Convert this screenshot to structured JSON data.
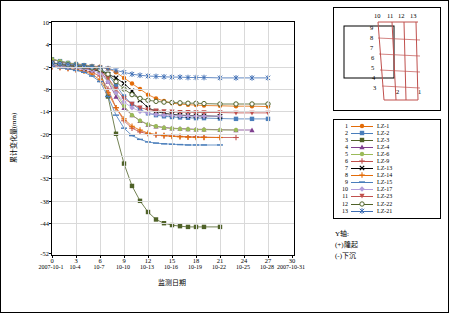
{
  "chart_data": {
    "type": "line",
    "title": "",
    "xlabel": "监测日期",
    "ylabel": "累计变化量(mm)",
    "ylim": [
      -52,
      10
    ],
    "yticks": [
      10,
      4,
      -2,
      -8,
      -14,
      -20,
      -26,
      -32,
      -38,
      -44,
      -52
    ],
    "xlim": [
      0,
      30
    ],
    "xticks": [
      0,
      3,
      6,
      9,
      12,
      15,
      18,
      21,
      24,
      27,
      30
    ],
    "xtick_dates": [
      "2007-10-1",
      "10-4",
      "10-7",
      "10-10",
      "10-13",
      "10-16",
      "10-19",
      "10-22",
      "10-25",
      "10-28",
      "2007-10-31"
    ],
    "grid": true,
    "legend_position": "right",
    "series": [
      {
        "num": "1",
        "name": "LZ-1",
        "color": "#E36C09",
        "marker": "circle",
        "x": [
          0,
          1,
          2,
          3,
          4,
          5,
          6,
          7,
          8,
          9,
          10,
          11,
          12,
          13,
          14,
          15,
          16,
          17,
          18,
          19,
          21,
          23,
          25,
          27
        ],
        "y": [
          0,
          -0.5,
          -1,
          -1.2,
          -1.5,
          -1.8,
          -2,
          -2.5,
          -3.5,
          -5,
          -6.5,
          -8,
          -9.5,
          -10.5,
          -11.2,
          -11.8,
          -12,
          -12.2,
          -12.3,
          -12.4,
          -12.5,
          -12.6,
          -12.6,
          -12.7
        ]
      },
      {
        "num": "2",
        "name": "LZ-2",
        "color": "#4A7EBB",
        "marker": "square",
        "x": [
          0,
          1,
          2,
          3,
          4,
          5,
          6,
          7,
          8,
          9,
          10,
          11,
          12,
          13,
          14,
          15,
          16,
          17,
          18,
          19,
          21,
          23,
          25,
          27
        ],
        "y": [
          0,
          -0.5,
          -1,
          -1.3,
          -1.6,
          -2,
          -2.4,
          -4,
          -7,
          -10,
          -12,
          -13.5,
          -14.5,
          -15,
          -15.3,
          -15.5,
          -15.6,
          -15.7,
          -15.8,
          -15.8,
          -15.9,
          -16,
          -16,
          -16
        ]
      },
      {
        "num": "3",
        "name": "LZ-3",
        "color": "#4F6228",
        "marker": "square-filled",
        "x": [
          0,
          1,
          2,
          3,
          4,
          5,
          6,
          7,
          8,
          9,
          10,
          11,
          12,
          13,
          14,
          15,
          16,
          17,
          18,
          19,
          21
        ],
        "y": [
          -1,
          -1.5,
          -1.8,
          -2,
          -2.2,
          -2.5,
          -3,
          -10,
          -20,
          -28,
          -34,
          -38,
          -41,
          -43,
          -44,
          -44.5,
          -44.8,
          -45,
          -45,
          -45,
          -45
        ]
      },
      {
        "num": "4",
        "name": "LZ-4",
        "color": "#7F3F8F",
        "marker": "triangle",
        "x": [
          0,
          1,
          2,
          3,
          4,
          5,
          6,
          7,
          8,
          9,
          10,
          11,
          12,
          13,
          14,
          15,
          16,
          17,
          18,
          19,
          21,
          23,
          25
        ],
        "y": [
          0,
          -0.6,
          -1.2,
          -1.5,
          -1.8,
          -2.2,
          -3,
          -6,
          -10,
          -13,
          -15,
          -16.5,
          -17.5,
          -18,
          -18.3,
          -18.5,
          -18.6,
          -18.7,
          -18.8,
          -18.8,
          -18.9,
          -19,
          -19
        ]
      },
      {
        "num": "5",
        "name": "LZ-6",
        "color": "#9BBB59",
        "marker": "circle-small",
        "x": [
          0,
          1,
          2,
          3,
          4,
          5,
          6,
          7,
          8,
          9,
          10,
          11,
          12,
          13,
          14,
          15,
          16,
          17,
          18,
          19,
          21,
          23
        ],
        "y": [
          0,
          -0.5,
          -1,
          -1.4,
          -1.7,
          -2,
          -2.5,
          -5,
          -9,
          -12.5,
          -15,
          -16.5,
          -17.5,
          -18,
          -18.4,
          -18.6,
          -18.7,
          -18.8,
          -18.9,
          -18.9,
          -19,
          -19
        ]
      },
      {
        "num": "6",
        "name": "LZ-9",
        "color": "#C0504D",
        "marker": "plus",
        "x": [
          0,
          1,
          2,
          3,
          4,
          5,
          6,
          7,
          8,
          9,
          10,
          11,
          12,
          13,
          14,
          15,
          16,
          17,
          18,
          19,
          21,
          23
        ],
        "y": [
          -2,
          -2.2,
          -2.5,
          -2.8,
          -3,
          -3.5,
          -4.5,
          -8,
          -13,
          -16.5,
          -18.5,
          -19.5,
          -20,
          -20.3,
          -20.5,
          -20.6,
          -20.7,
          -20.8,
          -20.8,
          -20.9,
          -21,
          -21
        ]
      },
      {
        "num": "7",
        "name": "LZ-13",
        "color": "#000000",
        "marker": "x",
        "x": [
          0,
          1,
          2,
          3,
          4,
          5,
          6,
          7,
          8,
          9,
          10,
          11,
          12,
          13,
          14,
          15,
          16,
          17,
          18,
          19,
          21
        ],
        "y": [
          -1.5,
          -1.8,
          -2,
          -2.2,
          -2.5,
          -2.8,
          -3.2,
          -4,
          -5,
          -6.5,
          -8.5,
          -11,
          -13,
          -14,
          -14.5,
          -14.8,
          -15,
          -15.1,
          -15.2,
          -15.2,
          -15.3
        ]
      },
      {
        "num": "8",
        "name": "LZ-14",
        "color": "#E36C09",
        "marker": "plus-thin",
        "x": [
          0,
          1,
          2,
          3,
          4,
          5,
          6,
          7,
          8,
          9,
          10,
          11,
          12,
          13,
          14,
          15,
          16,
          17,
          18,
          19,
          21
        ],
        "y": [
          -2,
          -2.2,
          -2.5,
          -2.8,
          -3.2,
          -4,
          -5.5,
          -9,
          -13,
          -16,
          -18,
          -19,
          -19.8,
          -20.2,
          -20.5,
          -20.7,
          -20.8,
          -20.9,
          -21,
          -21,
          -21
        ]
      },
      {
        "num": "9",
        "name": "LZ-15",
        "color": "#4A7EBB",
        "marker": "dash",
        "x": [
          0,
          1,
          2,
          3,
          4,
          5,
          6,
          7,
          8,
          9,
          10,
          11,
          12,
          13,
          14,
          15,
          16,
          17,
          18,
          19,
          21
        ],
        "y": [
          -2,
          -2.3,
          -2.6,
          -3,
          -3.5,
          -4.5,
          -6,
          -10,
          -15,
          -18.5,
          -20.5,
          -21.5,
          -22.2,
          -22.5,
          -22.7,
          -22.8,
          -22.9,
          -23,
          -23,
          -23,
          -23
        ]
      },
      {
        "num": "10",
        "name": "LZ-17",
        "color": "#B39DDB",
        "marker": "diamond",
        "x": [
          0,
          1,
          2,
          3,
          4,
          5,
          6,
          7,
          8,
          9,
          10,
          11,
          12,
          13,
          14,
          15,
          16,
          17,
          18,
          19,
          21
        ],
        "y": [
          -1.5,
          -1.8,
          -2,
          -2.3,
          -2.6,
          -3,
          -3.8,
          -6,
          -9,
          -11.5,
          -13,
          -14,
          -14.5,
          -14.8,
          -15,
          -15.1,
          -15.2,
          -15.2,
          -15.3,
          -15.3,
          -15.3
        ]
      },
      {
        "num": "11",
        "name": "LZ-23",
        "color": "#C0504D",
        "marker": "triangle-down",
        "x": [
          0,
          1,
          2,
          3,
          4,
          5,
          6,
          7,
          8,
          9,
          10,
          11,
          12,
          13,
          14,
          15,
          16,
          17,
          18,
          19,
          21,
          23,
          25,
          27
        ],
        "y": [
          -1,
          -1.3,
          -1.6,
          -1.9,
          -2.2,
          -2.6,
          -3,
          -5,
          -8,
          -10.5,
          -12,
          -13,
          -13.5,
          -13.8,
          -14,
          -14.1,
          -14.2,
          -14.2,
          -14.3,
          -14.3,
          -14.3,
          -14.4,
          -14.4,
          -14.4
        ]
      },
      {
        "num": "12",
        "name": "LZ-22",
        "color": "#4F6228",
        "marker": "circle-open",
        "x": [
          0,
          1,
          2,
          3,
          4,
          5,
          6,
          7,
          8,
          9,
          10,
          11,
          12,
          13,
          14,
          15,
          16,
          17,
          18,
          19,
          21,
          23,
          25,
          27
        ],
        "y": [
          -1,
          -1.2,
          -1.5,
          -1.8,
          -2,
          -2.3,
          -2.8,
          -4,
          -6,
          -8,
          -9.5,
          -10.5,
          -11,
          -11.3,
          -11.5,
          -11.6,
          -11.7,
          -11.8,
          -11.8,
          -11.9,
          -12,
          -12,
          -12,
          -12
        ]
      },
      {
        "num": "13",
        "name": "LZ-21",
        "color": "#3F6FB5",
        "marker": "star",
        "x": [
          0,
          1,
          2,
          3,
          4,
          5,
          6,
          7,
          8,
          9,
          10,
          11,
          12,
          13,
          14,
          15,
          16,
          17,
          18,
          19,
          21,
          23,
          25,
          27
        ],
        "y": [
          -1,
          -1.2,
          -1.4,
          -1.6,
          -1.8,
          -2,
          -2.2,
          -2.5,
          -3,
          -3.5,
          -4,
          -4.3,
          -4.5,
          -4.6,
          -4.7,
          -4.8,
          -4.8,
          -4.9,
          -4.9,
          -4.9,
          -5,
          -5,
          -5,
          -5
        ]
      }
    ]
  },
  "legend": {
    "rows": [
      {
        "num": "1",
        "label": "LZ-1"
      },
      {
        "num": "2",
        "label": "LZ-2"
      },
      {
        "num": "3",
        "label": "LZ-3"
      },
      {
        "num": "4",
        "label": "LZ-4"
      },
      {
        "num": "5",
        "label": "LZ-6"
      },
      {
        "num": "6",
        "label": "LZ-9"
      },
      {
        "num": "7",
        "label": "LZ-13"
      },
      {
        "num": "8",
        "label": "LZ-14"
      },
      {
        "num": "9",
        "label": "LZ-15"
      },
      {
        "num": "10",
        "label": "LZ-17"
      },
      {
        "num": "11",
        "label": "LZ-23"
      },
      {
        "num": "12",
        "label": "LZ-22"
      },
      {
        "num": "13",
        "label": "LZ-21"
      }
    ]
  },
  "diagram": {
    "top_labels": [
      "10",
      "11",
      "12",
      "13"
    ],
    "left_labels": [
      "9",
      "8",
      "7",
      "6",
      "5",
      "4",
      "3"
    ],
    "bottom_labels": [
      "2",
      "1"
    ]
  },
  "notes": {
    "line1": "Y轴:",
    "line2": "(+)隆起",
    "line3": "(-)下沉"
  }
}
